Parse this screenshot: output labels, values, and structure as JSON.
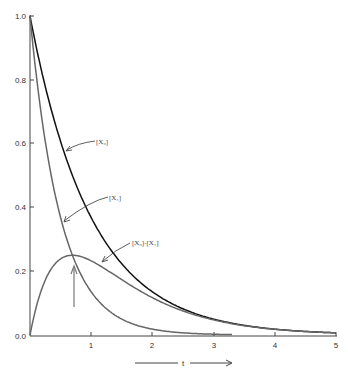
{
  "chart_data": {
    "type": "line",
    "title": "",
    "xlabel": "t",
    "ylabel": "",
    "xlim": [
      0,
      5
    ],
    "ylim": [
      0,
      1.0
    ],
    "grid": false,
    "legend": "none (curves labelled directly with arrows)",
    "x_ticks": [
      "1",
      "2",
      "3",
      "4",
      "5"
    ],
    "y_ticks": [
      "0.0",
      "0.2",
      "0.4",
      "0.6",
      "0.8",
      "1.0"
    ],
    "x": [
      0,
      0.1,
      0.2,
      0.3,
      0.4,
      0.5,
      0.6,
      0.693,
      0.8,
      0.9,
      1.0,
      1.25,
      1.5,
      1.75,
      2.0,
      2.5,
      3.0,
      3.5,
      4.0,
      4.5,
      5.0
    ],
    "series": [
      {
        "name": "[X₀]",
        "color": "#111111",
        "values": [
          1.0,
          0.905,
          0.819,
          0.741,
          0.67,
          0.607,
          0.549,
          0.5,
          0.449,
          0.407,
          0.368,
          0.287,
          0.223,
          0.174,
          0.135,
          0.082,
          0.05,
          0.03,
          0.018,
          0.011,
          0.007
        ]
      },
      {
        "name": "[X₁]",
        "color": "#666666",
        "values": [
          1.0,
          0.819,
          0.67,
          0.549,
          0.449,
          0.368,
          0.301,
          0.25,
          0.202,
          0.165,
          0.135,
          0.082,
          0.05,
          0.03,
          0.018,
          0.007,
          0.002,
          0.001,
          null,
          null,
          null
        ]
      },
      {
        "name": "[X₀]-[X₁]",
        "color": "#666666",
        "values": [
          0.0,
          0.086,
          0.149,
          0.192,
          0.221,
          0.239,
          0.248,
          0.25,
          0.247,
          0.242,
          0.233,
          0.205,
          0.173,
          0.144,
          0.117,
          0.075,
          0.047,
          0.029,
          0.018,
          0.011,
          0.007
        ]
      }
    ],
    "annotations": [
      {
        "text": "[X₀]",
        "points_to": "[X₀] curve near t≈0.55"
      },
      {
        "text": "[X₁]",
        "points_to": "[X₁] curve near t≈0.45"
      },
      {
        "text": "[X₀]-[X₁]",
        "points_to": "[X₀]-[X₁] curve near t≈1.3"
      },
      {
        "text": "vertical arrow",
        "points_to": "maximum of [X₀]-[X₁] at t≈0.7, value≈0.25"
      }
    ]
  },
  "labels": {
    "x0": "[X₀]",
    "x1": "[X₁]",
    "diff": "[X₀]-[X₁]",
    "xaxis": "t"
  },
  "ticks": {
    "x": [
      "1",
      "2",
      "3",
      "4",
      "5"
    ],
    "y": [
      "0.0",
      "0.2",
      "0.4",
      "0.6",
      "0.8",
      "1.0"
    ]
  }
}
